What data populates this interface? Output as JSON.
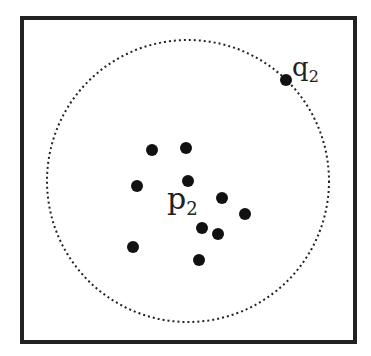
{
  "diagram": {
    "frame": {
      "x": 22,
      "y": 18,
      "w": 333,
      "h": 324,
      "stroke": "#222222"
    },
    "circle": {
      "cx": 188,
      "cy": 181,
      "r": 141,
      "style": "dotted",
      "stroke": "#222222"
    },
    "points": [
      {
        "x": 152,
        "y": 150
      },
      {
        "x": 186,
        "y": 148
      },
      {
        "x": 188,
        "y": 181
      },
      {
        "x": 137,
        "y": 186
      },
      {
        "x": 222,
        "y": 198
      },
      {
        "x": 245,
        "y": 214
      },
      {
        "x": 202,
        "y": 228
      },
      {
        "x": 218,
        "y": 234
      },
      {
        "x": 133,
        "y": 247
      },
      {
        "x": 199,
        "y": 260
      },
      {
        "x": 286,
        "y": 80
      }
    ],
    "labels": {
      "p": {
        "base": "p",
        "sub": "2",
        "x": 167,
        "y": 209
      },
      "q": {
        "base": "q",
        "sub": "2",
        "x": 292,
        "y": 76
      }
    }
  }
}
